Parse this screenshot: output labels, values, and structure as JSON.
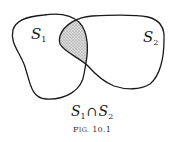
{
  "figure": {
    "caption_prefix": "F",
    "caption_smallcaps": "IG.",
    "caption_number": "10.1",
    "caption_full": "Fig. 10.1"
  },
  "sets": [
    {
      "name": "S",
      "subscript": "1",
      "label": "S1"
    },
    {
      "name": "S",
      "subscript": "2",
      "label": "S2"
    }
  ],
  "intersection": {
    "left_name": "S",
    "left_sub": "1",
    "operator": "∩",
    "right_name": "S",
    "right_sub": "2",
    "label": "S1 ∩ S2",
    "fill_pattern": "stippled gray"
  },
  "colors": {
    "stroke": "#1a1a1a",
    "shade_base": "#d6d6d6",
    "shade_dot": "#8a8a8a",
    "background": "#ffffff"
  }
}
